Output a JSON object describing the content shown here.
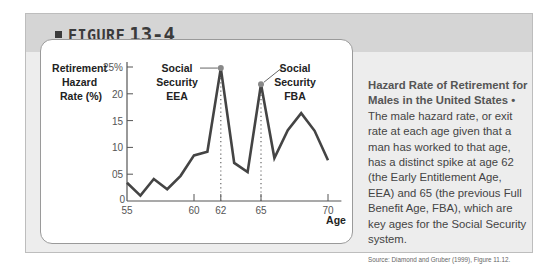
{
  "figure": {
    "label": "FIGURE",
    "number": "13-4"
  },
  "caption": {
    "title": "Hazard Rate of Retirement for Males in the United States",
    "bullet": "•",
    "body": "The male hazard rate, or exit rate at each age given that a man has worked to that age, has a distinct spike at age 62 (the Early Entitlement Age, EEA) and 65 (the previous Full Benefit Age, FBA), which are key ages for the Social Security system.",
    "source": "Source: Diamond and Gruber (1999), Figure 11.12."
  },
  "chart_data": {
    "type": "line",
    "title": "Hazard Rate of Retirement for Males in the United States",
    "ylabel": "Retirement Hazard Rate (%)",
    "xlabel": "Age",
    "x": [
      55,
      56,
      57,
      58,
      59,
      60,
      61,
      62,
      63,
      64,
      65,
      66,
      67,
      68,
      69,
      70
    ],
    "series": [
      {
        "name": "Male hazard rate",
        "values": [
          3.4,
          1.0,
          4.1,
          2.2,
          4.7,
          8.5,
          9.2,
          24.8,
          7.1,
          5.4,
          21.8,
          8.0,
          13.2,
          16.4,
          13.1,
          7.6
        ]
      }
    ],
    "xlim": [
      55,
      71
    ],
    "ylim": [
      0,
      25
    ],
    "xticks": [
      55,
      60,
      62,
      65,
      70
    ],
    "xtick_labels": [
      "55",
      "60",
      "62",
      "65",
      "70"
    ],
    "yticks": [
      0,
      5,
      10,
      15,
      20,
      25
    ],
    "ytick_labels": [
      "0",
      "05",
      "10",
      "15",
      "20",
      "25%"
    ],
    "grid": false,
    "annotations": [
      {
        "x": 62,
        "y": 24.8,
        "text": "Social Security EEA",
        "lines": [
          "Social",
          "Security",
          "EEA"
        ]
      },
      {
        "x": 65,
        "y": 21.8,
        "text": "Social Security FBA",
        "lines": [
          "Social",
          "Security",
          "FBA"
        ]
      }
    ],
    "reference_lines": [
      {
        "x": 62,
        "style": "dotted"
      },
      {
        "x": 65,
        "style": "dotted"
      }
    ],
    "colors": {
      "line": "#444444",
      "marker": "#888888",
      "axis": "#555555"
    }
  }
}
